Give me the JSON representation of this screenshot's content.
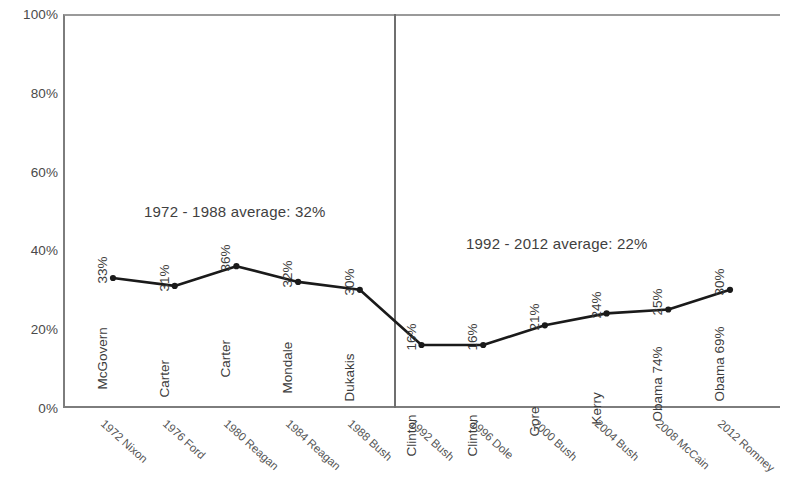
{
  "chart_data": {
    "type": "line",
    "title": "",
    "xlabel": "",
    "ylabel": "",
    "ylim": [
      0,
      100
    ],
    "ytick_labels": [
      "100%",
      "80%",
      "60%",
      "40%",
      "20%",
      "0%"
    ],
    "ytick_values": [
      100,
      80,
      60,
      40,
      20,
      0
    ],
    "grid": false,
    "legend": "none",
    "categories": [
      "1972 Nixon",
      "1976 Ford",
      "1980 Reagan",
      "1984 Reagan",
      "1988 Bush",
      "1992 Bush",
      "1996 Dole",
      "2000 Bush",
      "2004 Bush",
      "2008 McCain",
      "2012 Romney"
    ],
    "values": [
      33,
      31,
      36,
      32,
      30,
      16,
      16,
      21,
      24,
      25,
      30
    ],
    "point_labels": [
      "McGovern",
      "Carter",
      "Carter",
      "Mondale",
      "Dukakis",
      "Clinton",
      "Clinton",
      "Gore",
      "Kerry",
      "Obama 74%",
      "Obama 69%"
    ],
    "value_labels": [
      "33%",
      "31%",
      "36%",
      "32%",
      "30%",
      "16%",
      "16%",
      "21%",
      "24%",
      "25%",
      "30%"
    ],
    "annotations": [
      {
        "text": "1972 - 1988 average: 32%"
      },
      {
        "text": "1992 - 2012 average: 22%"
      }
    ],
    "divider": {
      "after_category": "1988 Bush"
    },
    "series_color": "#1a1a1a"
  }
}
